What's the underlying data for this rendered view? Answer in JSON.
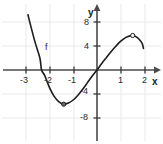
{
  "chart_data": {
    "type": "line",
    "title": "",
    "xlabel": "x",
    "ylabel": "y",
    "curve_label": "f",
    "xlim": [
      -3.3,
      2.4
    ],
    "ylim": [
      -10.5,
      10.0
    ],
    "grid": true,
    "legend": "none",
    "x_ticks": [
      -3,
      -2,
      -1,
      1,
      2
    ],
    "x_tick_labels": [
      "-3",
      "-2",
      "-1",
      "1",
      "2"
    ],
    "y_ticks": [
      8,
      4,
      -4,
      -8
    ],
    "y_tick_labels": [
      "8",
      "4",
      "-4",
      "-8"
    ],
    "series": [
      {
        "name": "f",
        "description": "cubic-like curve decreasing steeply from upper left, local minimum, rising through origin, local maximum, then decreasing",
        "points": [
          {
            "x": -2.9,
            "y": 9.2
          },
          {
            "x": -2.8,
            "y": 7.6
          },
          {
            "x": -2.6,
            "y": 4.6
          },
          {
            "x": -2.4,
            "y": 2.0
          },
          {
            "x": -2.33,
            "y": 0.0
          },
          {
            "x": -2.2,
            "y": -0.9
          },
          {
            "x": -2.0,
            "y": -2.9
          },
          {
            "x": -1.8,
            "y": -4.4
          },
          {
            "x": -1.6,
            "y": -5.3
          },
          {
            "x": -1.4,
            "y": -5.7
          },
          {
            "x": -1.2,
            "y": -5.5
          },
          {
            "x": -1.0,
            "y": -5.0
          },
          {
            "x": -0.8,
            "y": -4.2
          },
          {
            "x": -0.6,
            "y": -3.2
          },
          {
            "x": -0.4,
            "y": -2.1
          },
          {
            "x": -0.2,
            "y": -1.0
          },
          {
            "x": 0.0,
            "y": 0.0
          },
          {
            "x": 0.2,
            "y": 1.1
          },
          {
            "x": 0.4,
            "y": 2.1
          },
          {
            "x": 0.6,
            "y": 3.1
          },
          {
            "x": 0.8,
            "y": 4.0
          },
          {
            "x": 1.0,
            "y": 4.8
          },
          {
            "x": 1.2,
            "y": 5.4
          },
          {
            "x": 1.4,
            "y": 5.7
          },
          {
            "x": 1.5,
            "y": 5.75
          },
          {
            "x": 1.6,
            "y": 5.65
          },
          {
            "x": 1.75,
            "y": 5.2
          },
          {
            "x": 1.9,
            "y": 4.4
          },
          {
            "x": 1.95,
            "y": 3.6
          }
        ],
        "markers": [
          {
            "name": "local-minimum",
            "x": -1.4,
            "y": -5.7
          },
          {
            "name": "local-maximum",
            "x": 1.5,
            "y": 5.75
          }
        ]
      }
    ],
    "colors": {
      "curve": "#1a1a1a",
      "axis": "#4a4a4a",
      "grid": "#e8e8ee",
      "text": "#2b2b2b",
      "background": "#ffffff"
    }
  }
}
